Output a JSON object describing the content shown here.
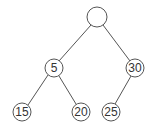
{
  "diagram": {
    "type": "binary-tree",
    "nodes": [
      {
        "id": "root",
        "label": "",
        "x": 97,
        "y": 17
      },
      {
        "id": "n5",
        "label": "5",
        "x": 54,
        "y": 68
      },
      {
        "id": "n30",
        "label": "30",
        "x": 135,
        "y": 68
      },
      {
        "id": "n15",
        "label": "15",
        "x": 22,
        "y": 112
      },
      {
        "id": "n20",
        "label": "20",
        "x": 81,
        "y": 112
      },
      {
        "id": "n25",
        "label": "25",
        "x": 111,
        "y": 112
      }
    ],
    "edges": [
      [
        "root",
        "n5"
      ],
      [
        "root",
        "n30"
      ],
      [
        "n5",
        "n15"
      ],
      [
        "n5",
        "n20"
      ],
      [
        "n30",
        "n25"
      ]
    ],
    "colors": {
      "stroke": "#555555",
      "text": "#333333",
      "background": "#ffffff"
    }
  }
}
